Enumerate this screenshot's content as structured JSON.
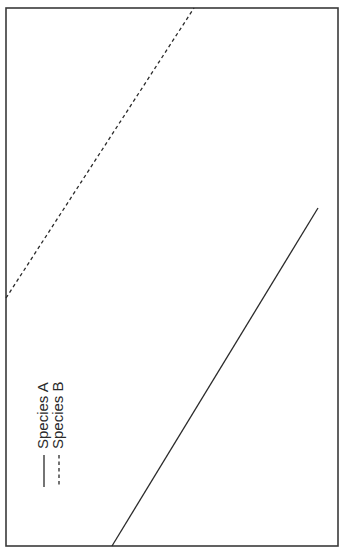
{
  "chart_data": {
    "type": "line",
    "title": "",
    "xlabel": "",
    "ylabel": "",
    "orientation": "rotated 90 degrees counter-clockwise",
    "grid": false,
    "ticks": false,
    "legend": {
      "position": "upper left (in rotated frame: lower-left of image)",
      "entries": [
        {
          "label": "Species A",
          "style": "solid"
        },
        {
          "label": "Species B",
          "style": "dashed"
        }
      ]
    },
    "series": [
      {
        "name": "Species A",
        "style": "solid",
        "color": "#2a2a2a",
        "points_px": [
          [
            112,
            546
          ],
          [
            318,
            208
          ]
        ]
      },
      {
        "name": "Species B",
        "style": "dashed",
        "color": "#2a2a2a",
        "points_px": [
          [
            6,
            298
          ],
          [
            194,
            8
          ]
        ]
      }
    ],
    "frame_px": {
      "left": 6,
      "top": 8,
      "right": 338,
      "bottom": 546
    }
  },
  "legend": {
    "a_label": "Species A",
    "b_label": "Species B"
  }
}
